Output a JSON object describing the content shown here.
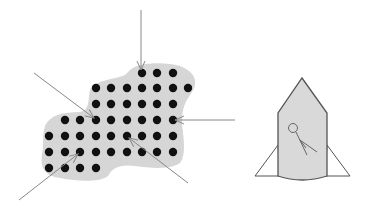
{
  "diagram": {
    "colors": {
      "background": "#ffffff",
      "blob_fill": "#d6d6d6",
      "dot": "#111111",
      "arrow": "#888888",
      "rocket_fill": "#d9d9d9",
      "rocket_stroke": "#555555",
      "fin_fill": "#ffffff"
    },
    "dot_grid": {
      "rows": [
        {
          "y": 73,
          "xs": [
            142,
            157,
            173
          ]
        },
        {
          "y": 88,
          "xs": [
            96,
            111,
            127,
            142,
            157,
            173,
            188
          ]
        },
        {
          "y": 104,
          "xs": [
            96,
            111,
            127,
            142,
            157,
            173
          ]
        },
        {
          "y": 120,
          "xs": [
            65,
            80,
            96,
            111,
            127,
            142,
            157,
            173
          ]
        },
        {
          "y": 136,
          "xs": [
            49,
            65,
            80,
            96,
            111,
            127,
            142,
            157,
            173
          ]
        },
        {
          "y": 152,
          "xs": [
            49,
            65,
            80,
            96,
            111,
            127,
            142,
            157,
            173
          ]
        },
        {
          "y": 168,
          "xs": [
            49,
            65,
            80,
            96
          ]
        }
      ]
    },
    "arrows": [
      {
        "name": "arrow-top",
        "x1": 141,
        "y1": 10,
        "x2": 141,
        "y2": 70
      },
      {
        "name": "arrow-top-left",
        "x1": 34,
        "y1": 73,
        "x2": 94,
        "y2": 118
      },
      {
        "name": "arrow-right",
        "x1": 235,
        "y1": 120,
        "x2": 175,
        "y2": 120
      },
      {
        "name": "arrow-bottom-center",
        "x1": 188,
        "y1": 183,
        "x2": 129,
        "y2": 138
      },
      {
        "name": "arrow-bottom-left",
        "x1": 19,
        "y1": 200,
        "x2": 78,
        "y2": 154
      }
    ]
  }
}
